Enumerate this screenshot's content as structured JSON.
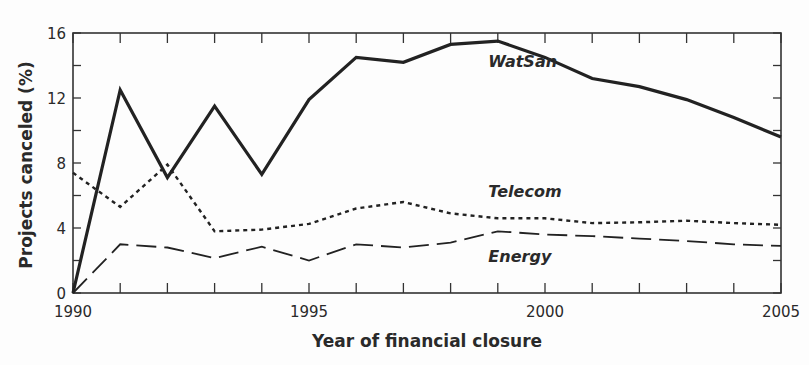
{
  "chart_data": {
    "type": "line",
    "title": "",
    "xlabel": "Year of financial closure",
    "ylabel": "Projects canceled (%)",
    "xlim": [
      1990,
      2005
    ],
    "ylim": [
      0,
      16
    ],
    "x_ticks_labeled": [
      1990,
      1995,
      2000,
      2005
    ],
    "y_ticks_labeled": [
      0,
      4,
      8,
      12,
      16
    ],
    "x_minor_ticks": 1,
    "y_minor_ticks": 2,
    "grid": false,
    "legend": "inline labels",
    "x": [
      1990,
      1991,
      1992,
      1993,
      1994,
      1995,
      1996,
      1997,
      1998,
      1999,
      2000,
      2001,
      2002,
      2003,
      2004,
      2005
    ],
    "series": [
      {
        "name": "WatSan",
        "style": "solid",
        "color": "#222222",
        "values": [
          0,
          12.5,
          7.1,
          11.5,
          7.3,
          11.9,
          14.5,
          14.2,
          15.3,
          15.5,
          14.5,
          13.2,
          12.7,
          11.9,
          10.8,
          9.6
        ]
      },
      {
        "name": "Telecom",
        "style": "dotted",
        "color": "#222222",
        "values": [
          7.4,
          5.3,
          7.9,
          3.8,
          3.9,
          4.25,
          5.2,
          5.6,
          4.9,
          4.6,
          4.6,
          4.3,
          4.35,
          4.45,
          4.3,
          4.2
        ]
      },
      {
        "name": "Energy",
        "style": "dashed",
        "color": "#222222",
        "values": [
          0,
          3.0,
          2.8,
          2.15,
          2.85,
          2.0,
          3.0,
          2.8,
          3.1,
          3.8,
          3.6,
          3.5,
          3.35,
          3.2,
          3.0,
          2.9
        ]
      }
    ],
    "annotations": [
      {
        "text": "WatSan",
        "x": 1998.8,
        "y": 13.9
      },
      {
        "text": "Telecom",
        "x": 1998.8,
        "y": 5.9
      },
      {
        "text": "Energy",
        "x": 1998.8,
        "y": 1.9
      }
    ]
  }
}
